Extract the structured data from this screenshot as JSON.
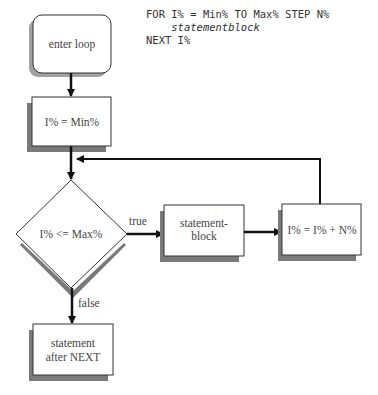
{
  "code": {
    "line1": "FOR I% = Min% TO Max% STEP N%",
    "line2": "    statementblock",
    "line3": "NEXT I%"
  },
  "nodes": {
    "enter": {
      "label": "enter loop"
    },
    "init": {
      "label": "I% = Min%"
    },
    "test": {
      "label": "I% <= Max%"
    },
    "body": {
      "line1": "statement-",
      "line2": "block"
    },
    "step": {
      "label": "I% = I% + N%"
    },
    "after": {
      "line1": "statement",
      "line2": "after NEXT"
    }
  },
  "edges": {
    "true_label": "true",
    "false_label": "false"
  },
  "colors": {
    "line": "#111111",
    "shadow": "#7a7a7a",
    "box_border": "#333333",
    "text": "#444444"
  }
}
